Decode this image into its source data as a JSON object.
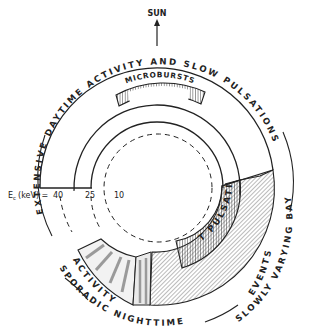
{
  "diagram": {
    "sun_label": "SUN",
    "energy_axis": {
      "label": "E",
      "subscript": "c",
      "unit": "(keV) =",
      "ticks": [
        "40",
        "25",
        "10"
      ]
    },
    "regions": {
      "daytime": "EXTENSIVE  DAYTIME  ACTIVITY  AND  SLOW  PULSATIONS",
      "microbursts": "MICROBURSTS",
      "fast_pulsations": "FAST PULSATIONS",
      "bay_line1": "SLOWLY  VARYING  BAY",
      "bay_line2": "EVENTS",
      "sporadic_line1": "SPORADIC  NIGHTTIME",
      "sporadic_line2": "ACTIVITY"
    },
    "colors": {
      "ink": "#222222",
      "shade": "#9a9a9a",
      "background": "#ffffff"
    }
  }
}
